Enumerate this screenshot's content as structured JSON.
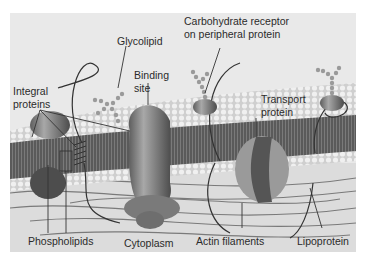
{
  "figure": {
    "background_color": "#e9e9e9",
    "labels": {
      "glycolipid": "Glycolipid",
      "carbohydrate_receptor_line1": "Carbohydrate receptor",
      "carbohydrate_receptor_line2": "on peripheral protein",
      "binding_site_line1": "Binding",
      "binding_site_line2": "site",
      "integral_proteins_line1": "Integral",
      "integral_proteins_line2": "proteins",
      "transport_protein_line1": "Transport",
      "transport_protein_line2": "protein",
      "phospholipids": "Phospholipids",
      "cytoplasm": "Cytoplasm",
      "actin_filaments": "Actin filaments",
      "lipoprotein": "Lipoprotein"
    },
    "colors": {
      "head": "#d9d9d9",
      "tail": "#4a4a4a",
      "protein": "#7e7e7e",
      "label_text": "#2b2b2b",
      "leader_line": "#333333"
    }
  }
}
